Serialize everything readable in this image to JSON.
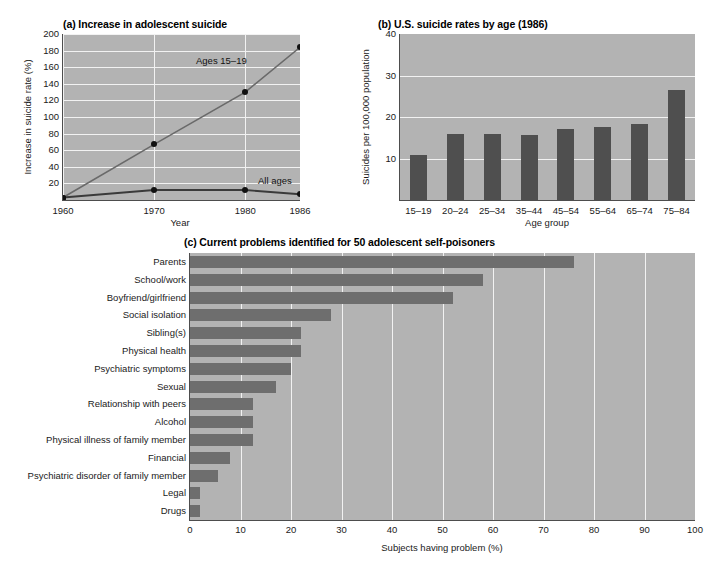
{
  "figure": {
    "colors": {
      "plot_background": "#b3b3b3",
      "gridline": "#f2f2f2",
      "bar_panel_b": "#4f4f4f",
      "bar_panel_c": "#6e6e6e",
      "line": "#4d4d4d",
      "marker": "#111111",
      "page_background": "#ffffff"
    }
  },
  "chart_data": [
    {
      "panel": "a",
      "type": "line",
      "title": "(a) Increase in adolescent suicide",
      "title_prefix": "(a)",
      "title_text": "Increase in adolescent suicide",
      "xlabel": "Year",
      "ylabel": "Increase in suicide rate (%)",
      "x": [
        1960,
        1970,
        1980,
        1986
      ],
      "xtick_labels": [
        "1960",
        "1970",
        "1980",
        "1986"
      ],
      "ytick_labels": [
        "20",
        "40",
        "60",
        "80",
        "100",
        "120",
        "140",
        "160",
        "180",
        "200"
      ],
      "ytick_values": [
        20,
        40,
        60,
        80,
        100,
        120,
        140,
        160,
        180,
        200
      ],
      "ylim": [
        0,
        200
      ],
      "grid": true,
      "series": [
        {
          "name": "Ages 15-19",
          "label": "Ages 15–19",
          "values": [
            3,
            67,
            130,
            184
          ]
        },
        {
          "name": "All ages",
          "label": "All ages",
          "values": [
            3,
            12,
            12,
            7
          ]
        }
      ]
    },
    {
      "panel": "b",
      "type": "bar",
      "title": "(b) U.S. suicide rates by age (1986)",
      "title_prefix": "(b)",
      "title_text": "U.S. suicide rates by age (1986)",
      "xlabel": "Age group",
      "ylabel": "Suicides per 100,000 population",
      "categories": [
        "15–19",
        "20–24",
        "25–34",
        "35–44",
        "45–54",
        "55–64",
        "65–74",
        "75–84"
      ],
      "values": [
        10.8,
        16.0,
        15.8,
        15.6,
        17.0,
        17.6,
        18.2,
        26.5
      ],
      "ytick_labels": [
        "10",
        "20",
        "30",
        "40"
      ],
      "ytick_values": [
        10,
        20,
        30,
        40
      ],
      "ylim": [
        0,
        40
      ],
      "grid": true
    },
    {
      "panel": "c",
      "type": "bar",
      "orientation": "horizontal",
      "title": "(c) Current problems identified for 50 adolescent self-poisoners",
      "title_prefix": "(c)",
      "title_text": "Current problems identified for 50 adolescent self-poisoners",
      "xlabel": "Subjects having problem (%)",
      "ylabel": "",
      "categories": [
        "Parents",
        "School/work",
        "Boyfriend/girlfriend",
        "Social isolation",
        "Sibling(s)",
        "Physical health",
        "Psychiatric symptoms",
        "Sexual",
        "Relationship with peers",
        "Alcohol",
        "Physical illness of family member",
        "Financial",
        "Psychiatric disorder of  family member",
        "Legal",
        "Drugs"
      ],
      "values": [
        76,
        58,
        52,
        28,
        22,
        22,
        20,
        17,
        12.5,
        12.5,
        12.5,
        8,
        5.5,
        2,
        2
      ],
      "xtick_labels": [
        "0",
        "10",
        "20",
        "30",
        "40",
        "50",
        "60",
        "70",
        "80",
        "90",
        "100"
      ],
      "xtick_values": [
        0,
        10,
        20,
        30,
        40,
        50,
        60,
        70,
        80,
        90,
        100
      ],
      "xlim": [
        0,
        100
      ],
      "grid": true
    }
  ]
}
